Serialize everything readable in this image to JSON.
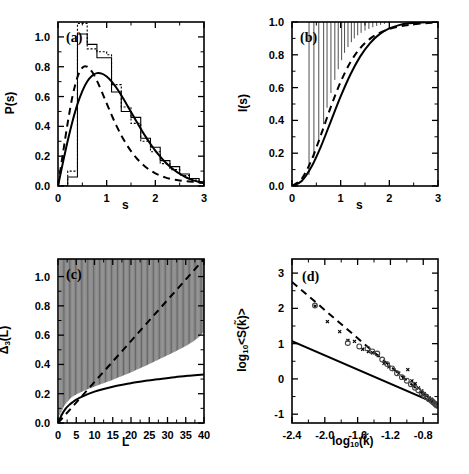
{
  "figure": {
    "panels": [
      "a",
      "b",
      "c",
      "d"
    ],
    "background": "#ffffff",
    "ink": "#000000"
  },
  "panel_a": {
    "tag": "(a)",
    "xlabel": "s",
    "ylabel_main": "P(s)",
    "xticks": [
      "0",
      "1",
      "2",
      "3"
    ],
    "yticks": [
      "0.0",
      "0.2",
      "0.4",
      "0.6",
      "0.8",
      "1.0"
    ]
  },
  "panel_b": {
    "tag": "(b)",
    "xlabel": "s",
    "ylabel_main": "I(s)",
    "xticks": [
      "0",
      "1",
      "2",
      "3"
    ],
    "yticks": [
      "0.0",
      "0.2",
      "0.4",
      "0.6",
      "0.8",
      "1.0"
    ]
  },
  "panel_c": {
    "tag": "(c)",
    "xlabel": "L",
    "ylabel_main": "Δ",
    "ylabel_sub": "3",
    "ylabel_tail": "(L)",
    "xticks": [
      "0",
      "5",
      "10",
      "15",
      "20",
      "25",
      "30",
      "35",
      "40"
    ],
    "yticks": [
      "0.0",
      "0.2",
      "0.4",
      "0.6",
      "0.8",
      "1.0"
    ]
  },
  "panel_d": {
    "tag": "(d)",
    "xlabel_main": "log",
    "xlabel_sub": "10",
    "xlabel_tail": "(k̃)",
    "ylabel_main": "log",
    "ylabel_sub": "10",
    "ylabel_tail": "<S(k̃)>",
    "xticks": [
      "-2.4",
      "-2.0",
      "-1.6",
      "-1.2",
      "-0.8"
    ],
    "yticks": [
      "-1",
      "0",
      "1",
      "2",
      "3"
    ]
  },
  "chart_data": [
    {
      "type": "line",
      "panel": "a",
      "title": "",
      "xlabel": "s",
      "ylabel": "P(s)",
      "xlim": [
        0,
        3
      ],
      "ylim": [
        0,
        1.1
      ],
      "grid": false,
      "legend": "none",
      "series": [
        {
          "name": "GOE (solid curve)",
          "style": "solid",
          "x": [
            0.0,
            0.1,
            0.2,
            0.3,
            0.4,
            0.5,
            0.6,
            0.7,
            0.8,
            0.9,
            1.0,
            1.1,
            1.2,
            1.3,
            1.4,
            1.5,
            1.6,
            1.7,
            1.8,
            1.9,
            2.0,
            2.1,
            2.2,
            2.3,
            2.4,
            2.5,
            2.6,
            2.7,
            2.8,
            2.9,
            3.0
          ],
          "y": [
            0.0,
            0.155,
            0.303,
            0.436,
            0.549,
            0.637,
            0.701,
            0.74,
            0.757,
            0.754,
            0.735,
            0.702,
            0.659,
            0.609,
            0.554,
            0.497,
            0.44,
            0.384,
            0.331,
            0.282,
            0.237,
            0.197,
            0.161,
            0.13,
            0.104,
            0.082,
            0.063,
            0.048,
            0.036,
            0.027,
            0.019
          ]
        },
        {
          "name": "Brody / intermediate (dashed curve)",
          "style": "dashed",
          "x": [
            0.0,
            0.1,
            0.2,
            0.3,
            0.4,
            0.5,
            0.6,
            0.7,
            0.8,
            0.9,
            1.0,
            1.1,
            1.2,
            1.3,
            1.4,
            1.5,
            1.6,
            1.7,
            1.8,
            1.9,
            2.0,
            2.1,
            2.2,
            2.3,
            2.4,
            2.5,
            2.6,
            2.7,
            2.8,
            2.9,
            3.0
          ],
          "y": [
            0.0,
            0.215,
            0.425,
            0.605,
            0.73,
            0.793,
            0.8,
            0.766,
            0.706,
            0.632,
            0.554,
            0.477,
            0.405,
            0.34,
            0.283,
            0.234,
            0.192,
            0.157,
            0.128,
            0.104,
            0.085,
            0.07,
            0.058,
            0.049,
            0.042,
            0.037,
            0.033,
            0.03,
            0.028,
            0.026,
            0.025
          ]
        },
        {
          "name": "numerical histogram (solid steps)",
          "style": "histogram-solid",
          "bin_edges": [
            0.0,
            0.1,
            0.2,
            0.3,
            0.4,
            0.5,
            0.6,
            0.7,
            0.8,
            0.9,
            1.0,
            1.1,
            1.2,
            1.3,
            1.4,
            1.5,
            1.6,
            1.7,
            1.8,
            1.9,
            2.0,
            2.1,
            2.2,
            2.3,
            2.4,
            2.5,
            2.6,
            2.7,
            2.8,
            2.9,
            3.0
          ],
          "counts": [
            0.0,
            0.0,
            0.06,
            0.06,
            1.02,
            1.02,
            0.95,
            0.95,
            0.86,
            0.86,
            0.86,
            0.63,
            0.63,
            0.5,
            0.5,
            0.46,
            0.46,
            0.32,
            0.32,
            0.26,
            0.26,
            0.17,
            0.17,
            0.13,
            0.13,
            0.08,
            0.08,
            0.05,
            0.05,
            0.02
          ]
        },
        {
          "name": "numerical histogram (dotted steps)",
          "style": "histogram-dotted",
          "bin_edges": [
            0.0,
            0.1,
            0.2,
            0.3,
            0.4,
            0.5,
            0.6,
            0.7,
            0.8,
            0.9,
            1.0,
            1.1,
            1.2,
            1.3,
            1.4,
            1.5,
            1.6,
            1.7,
            1.8,
            1.9,
            2.0,
            2.1,
            2.2,
            2.3,
            2.4,
            2.5,
            2.6,
            2.7,
            2.8,
            2.9,
            3.0
          ],
          "counts": [
            0.0,
            0.0,
            0.1,
            0.1,
            1.09,
            1.09,
            0.92,
            0.92,
            0.9,
            0.9,
            0.88,
            0.68,
            0.68,
            0.53,
            0.53,
            0.42,
            0.42,
            0.3,
            0.3,
            0.23,
            0.23,
            0.15,
            0.15,
            0.11,
            0.11,
            0.07,
            0.07,
            0.04,
            0.04,
            0.02
          ]
        }
      ]
    },
    {
      "type": "line",
      "panel": "b",
      "title": "",
      "xlabel": "s",
      "ylabel": "I(s)",
      "xlim": [
        0,
        3
      ],
      "ylim": [
        0,
        1.0
      ],
      "grid": false,
      "legend": "none",
      "series": [
        {
          "name": "GOE cumulative (solid)",
          "style": "solid",
          "x": [
            0.0,
            0.2,
            0.4,
            0.6,
            0.8,
            1.0,
            1.2,
            1.4,
            1.6,
            1.8,
            2.0,
            2.2,
            2.4,
            2.6,
            2.8,
            3.0
          ],
          "y": [
            0.0,
            0.031,
            0.117,
            0.245,
            0.396,
            0.546,
            0.68,
            0.789,
            0.87,
            0.926,
            0.961,
            0.981,
            0.992,
            0.997,
            0.999,
            1.0
          ]
        },
        {
          "name": "intermediate cumulative (dashed)",
          "style": "dashed",
          "x": [
            0.0,
            0.2,
            0.4,
            0.6,
            0.8,
            1.0,
            1.2,
            1.4,
            1.6,
            1.8,
            2.0,
            2.2,
            2.4,
            2.6,
            2.8,
            3.0
          ],
          "y": [
            0.0,
            0.044,
            0.158,
            0.316,
            0.484,
            0.635,
            0.755,
            0.84,
            0.897,
            0.934,
            0.957,
            0.972,
            0.982,
            0.989,
            0.994,
            0.997
          ]
        },
        {
          "name": "numerical data (diamonds)",
          "style": "markers-diamond",
          "x": [
            0.35,
            0.45,
            0.55,
            0.65,
            0.72,
            0.8,
            0.88,
            0.95,
            1.02,
            1.08,
            1.15,
            1.22,
            1.28,
            1.35,
            1.42,
            1.5,
            1.58,
            1.66,
            1.74,
            1.82,
            1.9,
            2.0,
            2.1,
            2.2,
            2.3,
            2.4,
            2.5,
            2.6,
            2.7,
            2.8,
            2.9
          ],
          "y": [
            0.045,
            0.15,
            0.25,
            0.355,
            0.455,
            0.545,
            0.625,
            0.69,
            0.745,
            0.79,
            0.825,
            0.855,
            0.878,
            0.897,
            0.912,
            0.925,
            0.936,
            0.946,
            0.954,
            0.961,
            0.967,
            0.973,
            0.978,
            0.982,
            0.986,
            0.989,
            0.992,
            0.994,
            0.996,
            0.998,
            0.999
          ]
        }
      ]
    },
    {
      "type": "line",
      "panel": "c",
      "title": "",
      "xlabel": "L",
      "ylabel": "Δ3(L)",
      "xlim": [
        0,
        40
      ],
      "ylim": [
        0,
        1.12
      ],
      "grid": false,
      "legend": "none",
      "series": [
        {
          "name": "Poisson L/15 (dashed)",
          "style": "dashed",
          "x": [
            0,
            40
          ],
          "y": [
            0.0,
            1.12
          ]
        },
        {
          "name": "GOE rigidity (solid)",
          "style": "solid",
          "x": [
            0,
            1,
            2,
            3,
            4,
            5,
            6,
            8,
            10,
            12,
            15,
            18,
            20,
            24,
            28,
            32,
            36,
            40
          ],
          "y": [
            0.0,
            0.055,
            0.095,
            0.122,
            0.142,
            0.159,
            0.173,
            0.196,
            0.214,
            0.229,
            0.248,
            0.263,
            0.272,
            0.288,
            0.301,
            0.313,
            0.323,
            0.332
          ]
        },
        {
          "name": "numerical data (diamonds)",
          "style": "markers-diamond",
          "x": [
            0.5,
            1,
            1.5,
            2,
            2.5,
            3,
            3.5,
            4,
            5,
            6,
            7,
            8,
            9,
            10,
            11,
            12,
            13,
            14,
            15,
            16,
            17,
            18,
            19,
            20,
            21,
            22,
            23,
            24,
            25,
            26,
            27,
            28,
            29,
            30,
            31,
            32,
            33,
            34,
            35,
            36,
            37,
            38,
            39,
            40
          ],
          "y": [
            0.03,
            0.06,
            0.085,
            0.105,
            0.12,
            0.135,
            0.148,
            0.158,
            0.172,
            0.185,
            0.196,
            0.207,
            0.216,
            0.226,
            0.236,
            0.245,
            0.254,
            0.263,
            0.272,
            0.283,
            0.293,
            0.303,
            0.313,
            0.323,
            0.335,
            0.346,
            0.357,
            0.368,
            0.38,
            0.392,
            0.404,
            0.416,
            0.428,
            0.44,
            0.452,
            0.464,
            0.477,
            0.49,
            0.503,
            0.518,
            0.534,
            0.552,
            0.574,
            0.6
          ]
        }
      ]
    },
    {
      "type": "scatter",
      "panel": "d",
      "title": "",
      "xlabel": "log10(k̃)",
      "ylabel": "log10<S(k̃)>",
      "xlim": [
        -2.4,
        -0.62
      ],
      "ylim": [
        -1.25,
        3.4
      ],
      "grid": false,
      "legend": "none",
      "series": [
        {
          "name": "slope -2 reference (dashed)",
          "style": "dashed",
          "x": [
            -2.4,
            -0.62
          ],
          "y": [
            2.75,
            -0.8
          ]
        },
        {
          "name": "slope -1 reference (solid)",
          "style": "solid",
          "x": [
            -2.4,
            -0.62
          ],
          "y": [
            1.07,
            -0.72
          ]
        },
        {
          "name": "data set 1 (crosses)",
          "style": "markers-cross",
          "x": [
            -2.1,
            -1.95,
            -1.8,
            -1.7,
            -1.62,
            -1.52,
            -1.45,
            -1.4,
            -1.33,
            -1.26,
            -1.2,
            -1.14,
            -1.08,
            -1.02,
            -0.97,
            -0.92,
            -0.88,
            -0.84,
            -0.8,
            -0.77,
            -0.74,
            -0.71,
            -0.68,
            -0.66,
            -0.64
          ],
          "y": [
            2.02,
            1.58,
            1.3,
            1.05,
            1.02,
            0.8,
            0.73,
            0.7,
            0.62,
            0.4,
            0.3,
            0.22,
            0.12,
            0.0,
            0.22,
            -0.1,
            -0.18,
            -0.3,
            -0.38,
            -0.46,
            -0.52,
            -0.58,
            -0.62,
            -0.68,
            -0.72
          ]
        },
        {
          "name": "data set 2 (circles)",
          "style": "markers-circle",
          "x": [
            -2.12,
            -1.72,
            -1.58,
            -1.48,
            -1.42,
            -1.36,
            -1.3,
            -1.24,
            -1.18,
            -1.12,
            -1.06,
            -1.0,
            -0.95,
            -0.9,
            -0.86,
            -0.82,
            -0.79,
            -0.76,
            -0.73,
            -0.7,
            -0.68,
            -0.66,
            -0.65,
            -0.64,
            -0.63
          ],
          "y": [
            2.08,
            1.02,
            0.92,
            0.86,
            0.78,
            0.72,
            0.55,
            0.42,
            0.3,
            0.16,
            0.05,
            -0.05,
            -0.15,
            -0.25,
            -0.32,
            -0.4,
            -0.46,
            -0.52,
            -0.58,
            -0.62,
            -0.66,
            -0.7,
            -0.72,
            -0.74,
            -0.76
          ]
        }
      ]
    }
  ]
}
